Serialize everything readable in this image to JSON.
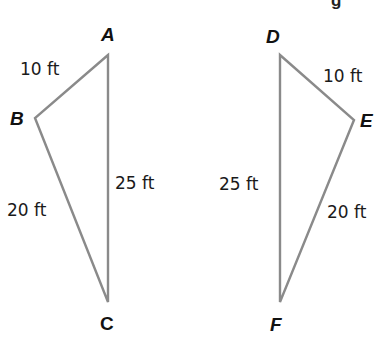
{
  "header": {
    "cutoff_text": "g"
  },
  "triangles": [
    {
      "name": "ABC",
      "vertices": {
        "A": {
          "label": "A",
          "x": 108,
          "y": 55
        },
        "B": {
          "label": "B",
          "x": 35,
          "y": 118
        },
        "C": {
          "label": "C",
          "x": 108,
          "y": 302
        }
      },
      "sides": {
        "AB": "10 ft",
        "BC": "20 ft",
        "AC": "25 ft"
      }
    },
    {
      "name": "DEF",
      "vertices": {
        "D": {
          "label": "D",
          "x": 280,
          "y": 55
        },
        "E": {
          "label": "E",
          "x": 354,
          "y": 120
        },
        "F": {
          "label": "F",
          "x": 280,
          "y": 302
        }
      },
      "sides": {
        "DE": "10 ft",
        "EF": "20 ft",
        "DF": "25 ft"
      }
    }
  ],
  "colors": {
    "edge": "#8a8a8a",
    "text": "#111111"
  }
}
